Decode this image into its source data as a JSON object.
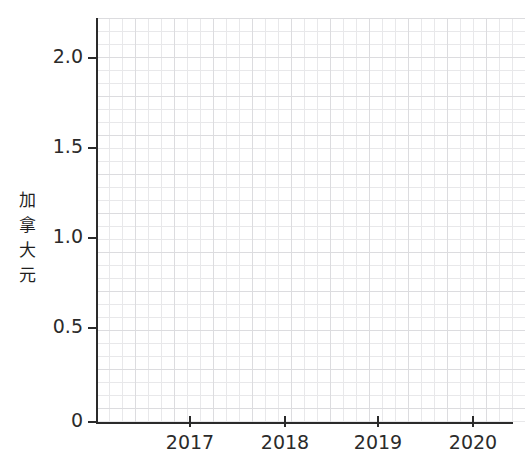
{
  "chart_data": {
    "type": "line",
    "title": "",
    "xlabel": "",
    "ylabel": "加拿大元",
    "series": [
      {
        "name": "",
        "values": []
      }
    ],
    "x": [],
    "xlim": [
      2016.3,
      2020.7
    ],
    "ylim": [
      0,
      2.15
    ],
    "x_ticks": [
      {
        "value": 2017,
        "label": "2017",
        "px": 190
      },
      {
        "value": 2018,
        "label": "2018",
        "px": 285
      },
      {
        "value": 2019,
        "label": "2019",
        "px": 378
      },
      {
        "value": 2020,
        "label": "2020",
        "px": 473
      }
    ],
    "y_ticks": [
      {
        "value": 2.0,
        "label": "2.0",
        "px": 58
      },
      {
        "value": 1.5,
        "label": "1.5",
        "px": 148
      },
      {
        "value": 1.0,
        "label": "1.0",
        "px": 238
      },
      {
        "value": 0.5,
        "label": "0.5",
        "px": 328
      },
      {
        "value": 0,
        "label": "0",
        "px": 422
      }
    ],
    "grid": true,
    "grid_minor": true,
    "legend": false,
    "legend_position": "none",
    "annotations": [],
    "note": "Plot canvas is empty — no data series are drawn."
  },
  "colors": {
    "background": "#ffffff",
    "axis": "#2b2b2b",
    "grid_minor": "#e8e8ea",
    "grid_major": "#dcdcdf",
    "tick_label": "#2b2b2b",
    "axis_title": "#1f1f1f"
  },
  "y_axis_title_chars": [
    "加",
    "拿",
    "大",
    "元"
  ]
}
